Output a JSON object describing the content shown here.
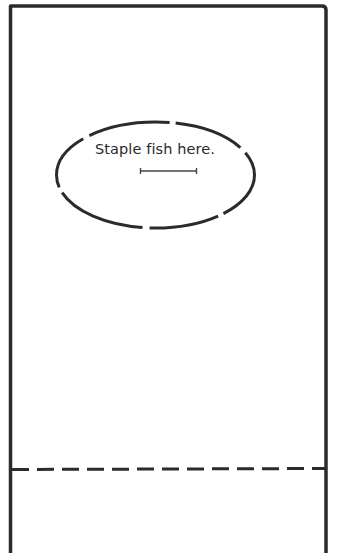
{
  "worksheet": {
    "instruction_label": "Staple fish here.",
    "staple_target_shape": "dashed-ellipse",
    "fold_line_style": "dashed",
    "colors": {
      "ink": "#2b2b2b",
      "paper": "#ffffff"
    }
  }
}
